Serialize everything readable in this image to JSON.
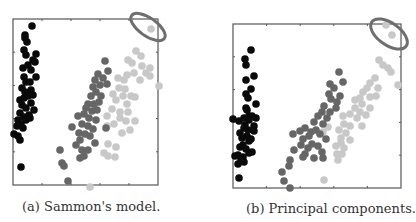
{
  "colors": {
    "class1": "#0a0a0a",
    "class2": "#666666",
    "class3": "#c8c8c8",
    "highlight": "#6e6e6e",
    "frame": "#555555"
  },
  "captions": {
    "a": "(a) Sammon's model.",
    "b": "(b) Principal components."
  },
  "chart_data": [
    {
      "type": "scatter",
      "title": "(a) Sammon's model.",
      "xlabel": "",
      "ylabel": "",
      "grid": false,
      "legend": null,
      "frame_px": {
        "x0": 13,
        "y0": 19,
        "x1": 158,
        "y1": 185
      },
      "annotations": [
        {
          "type": "ellipse",
          "cx": 148,
          "cy": 27,
          "rx": 20,
          "ry": 9,
          "rotate": 35,
          "note": "outlier highlighted"
        }
      ],
      "series": [
        {
          "name": "class1",
          "color": "#0a0a0a",
          "points": [
            [
              32,
              26
            ],
            [
              25,
              35
            ],
            [
              27,
              42
            ],
            [
              25,
              38
            ],
            [
              24,
              50
            ],
            [
              26,
              55
            ],
            [
              36,
              54
            ],
            [
              33,
              60
            ],
            [
              35,
              62
            ],
            [
              23,
              68
            ],
            [
              28,
              65
            ],
            [
              31,
              70
            ],
            [
              36,
              77
            ],
            [
              24,
              77
            ],
            [
              26,
              82
            ],
            [
              30,
              82
            ],
            [
              22,
              88
            ],
            [
              25,
              92
            ],
            [
              31,
              90
            ],
            [
              33,
              95
            ],
            [
              20,
              100
            ],
            [
              24,
              98
            ],
            [
              28,
              96
            ],
            [
              22,
              105
            ],
            [
              26,
              108
            ],
            [
              31,
              103
            ],
            [
              34,
              110
            ],
            [
              20,
              113
            ],
            [
              24,
              117
            ],
            [
              29,
              115
            ],
            [
              18,
              120
            ],
            [
              21,
              124
            ],
            [
              26,
              120
            ],
            [
              30,
              118
            ],
            [
              17,
              126
            ],
            [
              23,
              128
            ],
            [
              14,
              134
            ],
            [
              18,
              136
            ],
            [
              20,
              140
            ],
            [
              21,
              167
            ]
          ]
        },
        {
          "name": "class2",
          "color": "#666666",
          "points": [
            [
              105,
              61
            ],
            [
              108,
              71
            ],
            [
              98,
              74
            ],
            [
              95,
              80
            ],
            [
              103,
              78
            ],
            [
              93,
              87
            ],
            [
              100,
              85
            ],
            [
              107,
              84
            ],
            [
              96,
              92
            ],
            [
              91,
              96
            ],
            [
              101,
              96
            ],
            [
              88,
              104
            ],
            [
              94,
              104
            ],
            [
              99,
              102
            ],
            [
              86,
              108
            ],
            [
              92,
              111
            ],
            [
              97,
              110
            ],
            [
              78,
              116
            ],
            [
              84,
              114
            ],
            [
              89,
              118
            ],
            [
              96,
              120
            ],
            [
              72,
              127
            ],
            [
              82,
              124
            ],
            [
              88,
              126
            ],
            [
              93,
              129
            ],
            [
              79,
              133
            ],
            [
              85,
              134
            ],
            [
              90,
              136
            ],
            [
              80,
              140
            ],
            [
              95,
              143
            ],
            [
              76,
              145
            ],
            [
              82,
              150
            ],
            [
              88,
              150
            ],
            [
              84,
              156
            ],
            [
              80,
              158
            ],
            [
              60,
              150
            ],
            [
              62,
              163
            ],
            [
              64,
              166
            ],
            [
              68,
              181
            ],
            [
              106,
              128
            ]
          ]
        },
        {
          "name": "class3",
          "color": "#c8c8c8",
          "points": [
            [
              151,
              29
            ],
            [
              136,
              51
            ],
            [
              141,
              56
            ],
            [
              128,
              60
            ],
            [
              132,
              63
            ],
            [
              142,
              66
            ],
            [
              150,
              68
            ],
            [
              127,
              75
            ],
            [
              134,
              73
            ],
            [
              146,
              73
            ],
            [
              150,
              76
            ],
            [
              118,
              78
            ],
            [
              124,
              80
            ],
            [
              140,
              80
            ],
            [
              159,
              86
            ],
            [
              119,
              88
            ],
            [
              125,
              89
            ],
            [
              113,
              94
            ],
            [
              123,
              96
            ],
            [
              131,
              96
            ],
            [
              135,
              97
            ],
            [
              116,
              100
            ],
            [
              127,
              104
            ],
            [
              112,
              109
            ],
            [
              120,
              112
            ],
            [
              128,
              112
            ],
            [
              107,
              116
            ],
            [
              120,
              118
            ],
            [
              126,
              121
            ],
            [
              135,
              121
            ],
            [
              107,
              126
            ],
            [
              114,
              124
            ],
            [
              122,
              133
            ],
            [
              130,
              130
            ],
            [
              108,
              144
            ],
            [
              116,
              147
            ],
            [
              104,
              153
            ],
            [
              108,
              156
            ],
            [
              115,
              157
            ],
            [
              90,
              187
            ]
          ]
        }
      ]
    },
    {
      "type": "scatter",
      "title": "(b) Principal components.",
      "xlabel": "",
      "ylabel": "",
      "grid": false,
      "legend": null,
      "frame_px": {
        "x0": 233,
        "y0": 24,
        "x1": 401,
        "y1": 188
      },
      "annotations": [
        {
          "type": "ellipse",
          "cx": 389,
          "cy": 34,
          "rx": 21,
          "ry": 11,
          "rotate": 35,
          "note": "outliers highlighted"
        }
      ],
      "series": [
        {
          "name": "class1",
          "color": "#0a0a0a",
          "points": [
            [
              251,
              50
            ],
            [
              245,
              59
            ],
            [
              246,
              65
            ],
            [
              246,
              80
            ],
            [
              254,
              76
            ],
            [
              246,
              94
            ],
            [
              251,
              89
            ],
            [
              248,
              98
            ],
            [
              246,
              108
            ],
            [
              256,
              104
            ],
            [
              249,
              116
            ],
            [
              244,
              118
            ],
            [
              252,
              116
            ],
            [
              239,
              121
            ],
            [
              245,
              125
            ],
            [
              254,
              126
            ],
            [
              248,
              130
            ],
            [
              240,
              133
            ],
            [
              247,
              136
            ],
            [
              254,
              131
            ],
            [
              249,
              141
            ],
            [
              243,
              145
            ],
            [
              246,
              149
            ],
            [
              240,
              147
            ],
            [
              238,
              155
            ],
            [
              252,
              152
            ],
            [
              244,
              162
            ],
            [
              238,
              164
            ],
            [
              241,
              160
            ],
            [
              249,
              153
            ],
            [
              243,
              157
            ],
            [
              233,
              119
            ],
            [
              235,
              156
            ],
            [
              239,
              178
            ],
            [
              249,
              120
            ],
            [
              256,
              118
            ],
            [
              244,
              128
            ],
            [
              251,
              139
            ],
            [
              242,
              138
            ],
            [
              247,
              110
            ]
          ]
        },
        {
          "name": "class2",
          "color": "#666666",
          "points": [
            [
              339,
              72
            ],
            [
              343,
              82
            ],
            [
              330,
              84
            ],
            [
              334,
              88
            ],
            [
              340,
              96
            ],
            [
              329,
              94
            ],
            [
              331,
              99
            ],
            [
              337,
              102
            ],
            [
              324,
              106
            ],
            [
              322,
              112
            ],
            [
              330,
              112
            ],
            [
              327,
              118
            ],
            [
              336,
              108
            ],
            [
              318,
              116
            ],
            [
              314,
              122
            ],
            [
              323,
              124
            ],
            [
              316,
              130
            ],
            [
              311,
              132
            ],
            [
              320,
              134
            ],
            [
              326,
              139
            ],
            [
              309,
              136
            ],
            [
              303,
              139
            ],
            [
              312,
              144
            ],
            [
              318,
              146
            ],
            [
              322,
              152
            ],
            [
              308,
              148
            ],
            [
              305,
              154
            ],
            [
              314,
              158
            ],
            [
              323,
              158
            ],
            [
              300,
              131
            ],
            [
              305,
              128
            ],
            [
              293,
              134
            ],
            [
              294,
              150
            ],
            [
              303,
              157
            ],
            [
              301,
              145
            ],
            [
              290,
              160
            ],
            [
              289,
              166
            ],
            [
              282,
              172
            ],
            [
              284,
              181
            ],
            [
              290,
              188
            ]
          ]
        },
        {
          "name": "class3",
          "color": "#c8c8c8",
          "points": [
            [
              386,
              25
            ],
            [
              392,
              35
            ],
            [
              379,
              60
            ],
            [
              383,
              65
            ],
            [
              388,
              68
            ],
            [
              391,
              72
            ],
            [
              398,
              85
            ],
            [
              375,
              78
            ],
            [
              370,
              83
            ],
            [
              367,
              88
            ],
            [
              378,
              88
            ],
            [
              363,
              92
            ],
            [
              360,
              98
            ],
            [
              370,
              97
            ],
            [
              376,
              96
            ],
            [
              355,
              100
            ],
            [
              362,
              104
            ],
            [
              355,
              108
            ],
            [
              360,
              112
            ],
            [
              366,
              115
            ],
            [
              370,
              108
            ],
            [
              350,
              114
            ],
            [
              343,
              116
            ],
            [
              344,
              124
            ],
            [
              350,
              126
            ],
            [
              357,
              118
            ],
            [
              362,
              126
            ],
            [
              339,
              130
            ],
            [
              346,
              133
            ],
            [
              350,
              140
            ],
            [
              341,
              143
            ],
            [
              336,
              146
            ],
            [
              344,
              148
            ],
            [
              337,
              154
            ],
            [
              342,
              154
            ],
            [
              328,
              127
            ],
            [
              341,
              138
            ],
            [
              338,
              160
            ],
            [
              323,
              132
            ],
            [
              324,
              180
            ]
          ]
        }
      ]
    }
  ]
}
